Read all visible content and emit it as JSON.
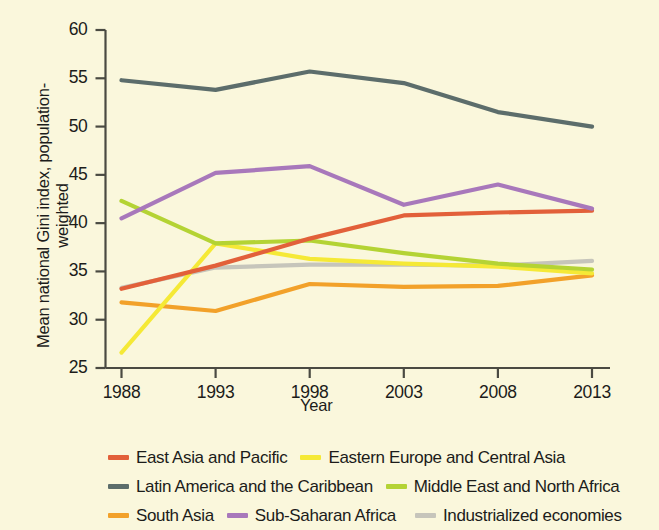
{
  "chart_data": {
    "type": "line",
    "title": "",
    "subtitle": "",
    "xlabel": "Year",
    "ylabel": "Mean national Gini index, population-weighted",
    "x": [
      1988,
      1993,
      1998,
      2003,
      2008,
      2013
    ],
    "xticklabels": [
      "1988",
      "1993",
      "1998",
      "2003",
      "2008",
      "2013"
    ],
    "yticklabels": [
      "25",
      "30",
      "35",
      "40",
      "45",
      "50",
      "55",
      "60"
    ],
    "yticks": [
      25,
      30,
      35,
      40,
      45,
      50,
      55,
      60
    ],
    "xlim": [
      1988,
      2013
    ],
    "ylim": [
      25,
      60
    ],
    "grid": false,
    "legend_position": "below",
    "series": [
      {
        "name": "East Asia and Pacific",
        "color": "#e2603a",
        "values": [
          33.2,
          35.6,
          38.4,
          40.8,
          41.1,
          41.3
        ]
      },
      {
        "name": "Eastern Europe and Central Asia",
        "color": "#f5e936",
        "values": [
          26.6,
          37.9,
          36.3,
          35.8,
          35.5,
          34.8
        ]
      },
      {
        "name": "Latin America and the Caribbean",
        "color": "#5c6d6b",
        "values": [
          54.8,
          53.8,
          55.7,
          54.5,
          51.5,
          50.0
        ]
      },
      {
        "name": "Middle East and North Africa",
        "color": "#b4d334",
        "values": [
          42.3,
          37.9,
          38.2,
          36.9,
          35.8,
          35.2
        ]
      },
      {
        "name": "South Asia",
        "color": "#f2a12a",
        "values": [
          31.8,
          30.9,
          33.7,
          33.4,
          33.5,
          34.6
        ]
      },
      {
        "name": "Sub-Saharan Africa",
        "color": "#a878bb",
        "values": [
          40.5,
          45.2,
          45.9,
          41.9,
          44.0,
          41.5
        ]
      },
      {
        "name": "Industrialized economies",
        "color": "#c6c5bb",
        "values": [
          33.3,
          35.4,
          35.7,
          35.7,
          35.6,
          36.1
        ]
      }
    ]
  },
  "legend": {
    "rows": [
      [
        {
          "name": "East Asia and Pacific",
          "color": "#e2603a"
        },
        {
          "name": "Eastern Europe and Central Asia",
          "color": "#f5e936"
        }
      ],
      [
        {
          "name": "Latin America and the Caribbean",
          "color": "#5c6d6b"
        },
        {
          "name": "Middle East and North Africa",
          "color": "#b4d334"
        }
      ],
      [
        {
          "name": "South Asia",
          "color": "#f2a12a"
        },
        {
          "name": "Sub-Saharan Africa",
          "color": "#a878bb"
        },
        {
          "name": "Industrialized economies",
          "color": "#c6c5bb"
        }
      ]
    ]
  },
  "style": {
    "background": "#faf7dc",
    "axis_color": "#4a4a42",
    "text_color": "#1c1c1a"
  }
}
